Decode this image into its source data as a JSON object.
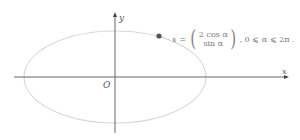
{
  "diagram": {
    "type": "ellipse-parametric",
    "axes": {
      "x_label": "x",
      "y_label": "y",
      "origin_label": "O"
    },
    "ellipse": {
      "semi_major": 2,
      "semi_minor": 1,
      "color": "#d6d6d6"
    },
    "point": {
      "color": "#555555"
    },
    "formula": {
      "lhs": "x",
      "eq": "=",
      "top": "2 cos α",
      "bottom": "sin α",
      "domain": ", 0 ⩽ α ⩽ 2π ."
    }
  }
}
